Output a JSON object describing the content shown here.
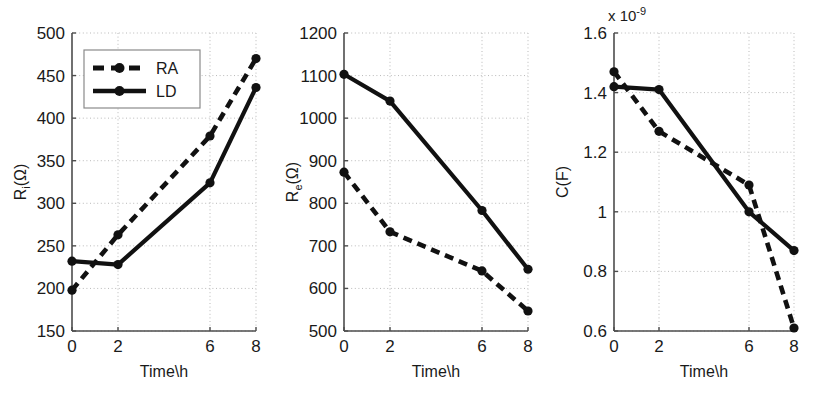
{
  "figure": {
    "background": "#ffffff",
    "line_color": "#111111",
    "grid_color": "#b9b9b9",
    "axis_color": "#4d4d4d"
  },
  "panels": [
    {
      "name": "panel-ri",
      "xlabel": "Time\\h",
      "ylabel_main": "R",
      "ylabel_sub": "i",
      "ylabel_tail": "(Ω)",
      "xticks": [
        "0",
        "2",
        "6",
        "8"
      ],
      "yticks": [
        "150",
        "200",
        "250",
        "300",
        "350",
        "400",
        "450",
        "500"
      ],
      "exponent": null,
      "legend": {
        "visible": true,
        "items": [
          "RA",
          "LD"
        ]
      }
    },
    {
      "name": "panel-re",
      "xlabel": "Time\\h",
      "ylabel_main": "R",
      "ylabel_sub": "e",
      "ylabel_tail": "(Ω)",
      "xticks": [
        "0",
        "2",
        "6",
        "8"
      ],
      "yticks": [
        "500",
        "600",
        "700",
        "800",
        "900",
        "1000",
        "1100",
        "1200"
      ],
      "exponent": null,
      "legend": {
        "visible": false,
        "items": []
      }
    },
    {
      "name": "panel-c",
      "xlabel": "Time\\h",
      "ylabel_main": "C(F)",
      "ylabel_sub": "",
      "ylabel_tail": "",
      "xticks": [
        "0",
        "2",
        "6",
        "8"
      ],
      "yticks": [
        "0.6",
        "0.8",
        "1",
        "1.2",
        "1.4",
        "1.6"
      ],
      "exponent": {
        "mantissa": "x 10",
        "power": "-9"
      },
      "legend": {
        "visible": false,
        "items": []
      }
    }
  ],
  "chart_data": [
    {
      "type": "line",
      "title": "",
      "xlabel": "Time\\h",
      "ylabel": "R_i(Ω)",
      "x": [
        0,
        2,
        6,
        8
      ],
      "xlim": [
        0,
        8
      ],
      "ylim": [
        150,
        500
      ],
      "xticks": [
        0,
        2,
        6,
        8
      ],
      "yticks": [
        150,
        200,
        250,
        300,
        350,
        400,
        450,
        500
      ],
      "grid": true,
      "legend_position": "upper-left",
      "series": [
        {
          "name": "RA",
          "style": "dashed",
          "marker": "circle",
          "values": [
            198,
            263,
            379,
            470
          ]
        },
        {
          "name": "LD",
          "style": "solid",
          "marker": "circle",
          "values": [
            232,
            228,
            324,
            436
          ]
        }
      ]
    },
    {
      "type": "line",
      "title": "",
      "xlabel": "Time\\h",
      "ylabel": "R_e(Ω)",
      "x": [
        0,
        2,
        6,
        8
      ],
      "xlim": [
        0,
        8
      ],
      "ylim": [
        500,
        1200
      ],
      "xticks": [
        0,
        2,
        6,
        8
      ],
      "yticks": [
        500,
        600,
        700,
        800,
        900,
        1000,
        1100,
        1200
      ],
      "grid": true,
      "legend_position": "none",
      "series": [
        {
          "name": "RA",
          "style": "dashed",
          "marker": "circle",
          "values": [
            873,
            733,
            641,
            547
          ]
        },
        {
          "name": "LD",
          "style": "solid",
          "marker": "circle",
          "values": [
            1103,
            1040,
            783,
            645
          ]
        }
      ]
    },
    {
      "type": "line",
      "title": "",
      "xlabel": "Time\\h",
      "ylabel": "C(F)",
      "y_multiplier": "x 10^-9",
      "x": [
        0,
        2,
        6,
        8
      ],
      "xlim": [
        0,
        8
      ],
      "ylim": [
        0.6,
        1.6
      ],
      "xticks": [
        0,
        2,
        6,
        8
      ],
      "yticks": [
        0.6,
        0.8,
        1.0,
        1.2,
        1.4,
        1.6
      ],
      "grid": true,
      "legend_position": "none",
      "series": [
        {
          "name": "RA",
          "style": "dashed",
          "marker": "circle",
          "values": [
            1.47,
            1.27,
            1.09,
            0.61
          ]
        },
        {
          "name": "LD",
          "style": "solid",
          "marker": "circle",
          "values": [
            1.42,
            1.41,
            1.0,
            0.87
          ]
        }
      ]
    }
  ]
}
